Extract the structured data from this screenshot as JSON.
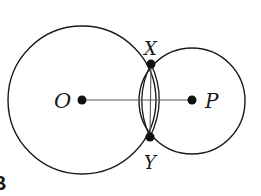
{
  "diagram": {
    "figure_label": "B",
    "colors": {
      "stroke": "#1a1a1a",
      "thin_stroke": "#555555",
      "background": "#ffffff"
    },
    "circles": [
      {
        "id": "circle-O",
        "center_label": "O",
        "cx": 82,
        "cy": 100,
        "r": 74
      },
      {
        "id": "circle-P",
        "center_label": "P",
        "cx": 192,
        "cy": 101,
        "r": 53
      }
    ],
    "points": [
      {
        "label": "O",
        "x": 82,
        "y": 100
      },
      {
        "label": "P",
        "x": 192,
        "y": 100
      },
      {
        "label": "X",
        "x": 151,
        "y": 64
      },
      {
        "label": "Y",
        "x": 150,
        "y": 137
      }
    ],
    "segments": [
      {
        "from": "O",
        "to": "P"
      },
      {
        "from": "X",
        "to": "Y"
      }
    ],
    "labels": {
      "O": "O",
      "P": "P",
      "X": "X",
      "Y": "Y"
    }
  }
}
